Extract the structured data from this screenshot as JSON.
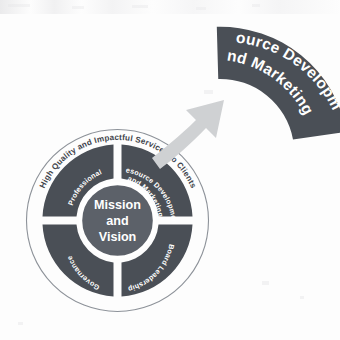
{
  "diagram": {
    "title_text": "High Quality and Impactful Services to Clients",
    "hub": {
      "line1": "Mission",
      "line2": "and",
      "line3": "Vision"
    },
    "segments": [
      {
        "id": "professional-leadership",
        "line1": "Professional",
        "line2": "Leadership"
      },
      {
        "id": "resource-development-and-marketing",
        "line1": "Resource Development",
        "line2": "and Marketing"
      },
      {
        "id": "board-leadership",
        "line1": "Board Leadership",
        "line2": ""
      },
      {
        "id": "governance",
        "line1": "Governance",
        "line2": ""
      }
    ],
    "callout": {
      "line1": "Resource Development",
      "line2": "and Marketing"
    },
    "colors": {
      "segment_fill": "#4a4f56",
      "hub_fill": "#5c6169",
      "ring_outline": "#8d9299",
      "arrow_fill": "#cfd1d3",
      "label_text": "#ffffff",
      "ring_text": "#3f444b",
      "background": "#fdfdfd"
    }
  }
}
